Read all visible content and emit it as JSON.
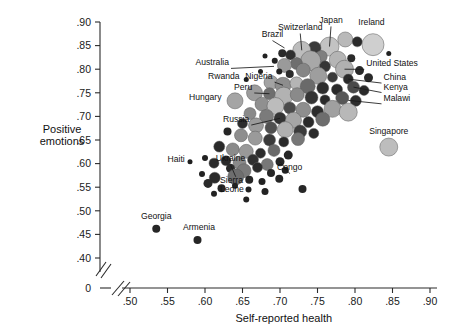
{
  "chart_data": {
    "type": "scatter",
    "title": "",
    "xlabel": "Self-reported health",
    "ylabel": "Positive emotions",
    "xlim": [
      0.475,
      0.905
    ],
    "ylim": [
      0.385,
      0.905
    ],
    "xticks": [
      0.5,
      0.55,
      0.6,
      0.65,
      0.7,
      0.75,
      0.8,
      0.85,
      0.9
    ],
    "xticklabels": [
      ".50",
      ".55",
      ".60",
      ".65",
      ".70",
      ".75",
      ".80",
      ".85",
      ".90"
    ],
    "yticks": [
      0.4,
      0.45,
      0.5,
      0.55,
      0.6,
      0.65,
      0.7,
      0.75,
      0.8,
      0.85,
      0.9
    ],
    "yticklabels": [
      ".40",
      ".45",
      ".50",
      ".55",
      ".60",
      ".65",
      ".70",
      ".75",
      ".80",
      ".85",
      ".90"
    ],
    "origin_label": "0",
    "axis_break": true,
    "grid": false,
    "legend": "none",
    "size_encoding": "bubble area",
    "color_encoding": "grayscale shade",
    "points": [
      {
        "x": 0.787,
        "y": 0.863,
        "r": 7.5,
        "c": "#b9b9b9"
      },
      {
        "x": 0.803,
        "y": 0.858,
        "r": 5.0,
        "c": "#2a2a2a"
      },
      {
        "x": 0.824,
        "y": 0.852,
        "r": 11.0,
        "c": "#cfcfcf"
      },
      {
        "x": 0.766,
        "y": 0.848,
        "r": 9.5,
        "c": "#c3c3c3"
      },
      {
        "x": 0.746,
        "y": 0.845,
        "r": 6.5,
        "c": "#3a3a3a"
      },
      {
        "x": 0.729,
        "y": 0.84,
        "r": 9.0,
        "c": "#bdbdbd"
      },
      {
        "x": 0.714,
        "y": 0.83,
        "r": 5.0,
        "c": "#2e2e2e"
      },
      {
        "x": 0.703,
        "y": 0.834,
        "r": 4.0,
        "c": "#2a2a2a"
      },
      {
        "x": 0.755,
        "y": 0.827,
        "r": 6.0,
        "c": "#7f7f7f"
      },
      {
        "x": 0.777,
        "y": 0.82,
        "r": 8.5,
        "c": "#b5b5b5"
      },
      {
        "x": 0.795,
        "y": 0.823,
        "r": 4.0,
        "c": "#2a2a2a"
      },
      {
        "x": 0.845,
        "y": 0.833,
        "r": 2.5,
        "c": "#222"
      },
      {
        "x": 0.741,
        "y": 0.818,
        "r": 10.0,
        "c": "#a8a8a8"
      },
      {
        "x": 0.722,
        "y": 0.812,
        "r": 6.0,
        "c": "#6e6e6e"
      },
      {
        "x": 0.706,
        "y": 0.808,
        "r": 7.0,
        "c": "#9a9a9a"
      },
      {
        "x": 0.693,
        "y": 0.818,
        "r": 3.0,
        "c": "#222"
      },
      {
        "x": 0.68,
        "y": 0.828,
        "r": 2.5,
        "c": "#222"
      },
      {
        "x": 0.76,
        "y": 0.806,
        "r": 5.5,
        "c": "#353535"
      },
      {
        "x": 0.786,
        "y": 0.8,
        "r": 9.0,
        "c": "#b0b0b0"
      },
      {
        "x": 0.806,
        "y": 0.797,
        "r": 4.5,
        "c": "#2a2a2a"
      },
      {
        "x": 0.731,
        "y": 0.798,
        "r": 7.0,
        "c": "#858585"
      },
      {
        "x": 0.713,
        "y": 0.79,
        "r": 4.0,
        "c": "#2c2c2c"
      },
      {
        "x": 0.699,
        "y": 0.795,
        "r": 3.0,
        "c": "#222"
      },
      {
        "x": 0.674,
        "y": 0.795,
        "r": 2.5,
        "c": "#222"
      },
      {
        "x": 0.751,
        "y": 0.786,
        "r": 8.5,
        "c": "#9e9e9e"
      },
      {
        "x": 0.77,
        "y": 0.783,
        "r": 5.0,
        "c": "#3a3a3a"
      },
      {
        "x": 0.791,
        "y": 0.779,
        "r": 5.0,
        "c": "#2a2a2a"
      },
      {
        "x": 0.818,
        "y": 0.782,
        "r": 4.5,
        "c": "#2a2a2a"
      },
      {
        "x": 0.655,
        "y": 0.778,
        "r": 2.5,
        "c": "#1f1f1f"
      },
      {
        "x": 0.688,
        "y": 0.772,
        "r": 7.0,
        "c": "#a3a3a3"
      },
      {
        "x": 0.704,
        "y": 0.766,
        "r": 8.0,
        "c": "#8d8d8d"
      },
      {
        "x": 0.722,
        "y": 0.77,
        "r": 6.5,
        "c": "#b5b5b5"
      },
      {
        "x": 0.737,
        "y": 0.764,
        "r": 7.5,
        "c": "#6a6a6a"
      },
      {
        "x": 0.757,
        "y": 0.76,
        "r": 6.0,
        "c": "#2f2f2f"
      },
      {
        "x": 0.776,
        "y": 0.757,
        "r": 5.5,
        "c": "#2a2a2a"
      },
      {
        "x": 0.798,
        "y": 0.762,
        "r": 6.0,
        "c": "#4a4a4a"
      },
      {
        "x": 0.812,
        "y": 0.755,
        "r": 5.0,
        "c": "#2a2a2a"
      },
      {
        "x": 0.666,
        "y": 0.75,
        "r": 8.0,
        "c": "#9c9c9c"
      },
      {
        "x": 0.686,
        "y": 0.748,
        "r": 6.0,
        "c": "#6f6f6f"
      },
      {
        "x": 0.705,
        "y": 0.743,
        "r": 9.0,
        "c": "#b2b2b2"
      },
      {
        "x": 0.723,
        "y": 0.746,
        "r": 7.0,
        "c": "#8a8a8a"
      },
      {
        "x": 0.742,
        "y": 0.74,
        "r": 6.5,
        "c": "#353535"
      },
      {
        "x": 0.76,
        "y": 0.735,
        "r": 5.0,
        "c": "#2a2a2a"
      },
      {
        "x": 0.783,
        "y": 0.739,
        "r": 6.5,
        "c": "#585858"
      },
      {
        "x": 0.801,
        "y": 0.733,
        "r": 5.5,
        "c": "#2e2e2e"
      },
      {
        "x": 0.64,
        "y": 0.733,
        "r": 8.0,
        "c": "#a5a5a5"
      },
      {
        "x": 0.676,
        "y": 0.726,
        "r": 7.0,
        "c": "#909090"
      },
      {
        "x": 0.694,
        "y": 0.722,
        "r": 8.5,
        "c": "#bcbcbc"
      },
      {
        "x": 0.713,
        "y": 0.718,
        "r": 6.0,
        "c": "#4b4b4b"
      },
      {
        "x": 0.731,
        "y": 0.714,
        "r": 7.5,
        "c": "#8e8e8e"
      },
      {
        "x": 0.75,
        "y": 0.71,
        "r": 6.0,
        "c": "#2c2c2c"
      },
      {
        "x": 0.77,
        "y": 0.716,
        "r": 8.5,
        "c": "#a0a0a0"
      },
      {
        "x": 0.791,
        "y": 0.709,
        "r": 9.0,
        "c": "#b8b8b8"
      },
      {
        "x": 0.66,
        "y": 0.706,
        "r": 6.0,
        "c": "#8a8a8a"
      },
      {
        "x": 0.682,
        "y": 0.7,
        "r": 7.0,
        "c": "#7b7b7b"
      },
      {
        "x": 0.7,
        "y": 0.696,
        "r": 6.0,
        "c": "#333"
      },
      {
        "x": 0.718,
        "y": 0.692,
        "r": 8.0,
        "c": "#a6a6a6"
      },
      {
        "x": 0.738,
        "y": 0.688,
        "r": 5.5,
        "c": "#2a2a2a"
      },
      {
        "x": 0.757,
        "y": 0.694,
        "r": 7.0,
        "c": "#6d6d6d"
      },
      {
        "x": 0.65,
        "y": 0.685,
        "r": 5.0,
        "c": "#2d2d2d"
      },
      {
        "x": 0.668,
        "y": 0.681,
        "r": 7.5,
        "c": "#9b9b9b"
      },
      {
        "x": 0.688,
        "y": 0.676,
        "r": 6.0,
        "c": "#505050"
      },
      {
        "x": 0.707,
        "y": 0.672,
        "r": 8.0,
        "c": "#b0b0b0"
      },
      {
        "x": 0.727,
        "y": 0.668,
        "r": 6.5,
        "c": "#3c3c3c"
      },
      {
        "x": 0.745,
        "y": 0.664,
        "r": 5.0,
        "c": "#2a2a2a"
      },
      {
        "x": 0.63,
        "y": 0.668,
        "r": 4.0,
        "c": "#262626"
      },
      {
        "x": 0.648,
        "y": 0.66,
        "r": 6.5,
        "c": "#8f8f8f"
      },
      {
        "x": 0.667,
        "y": 0.654,
        "r": 7.0,
        "c": "#9a9a9a"
      },
      {
        "x": 0.686,
        "y": 0.65,
        "r": 6.0,
        "c": "#3a3a3a"
      },
      {
        "x": 0.705,
        "y": 0.646,
        "r": 5.0,
        "c": "#2a2a2a"
      },
      {
        "x": 0.724,
        "y": 0.652,
        "r": 6.5,
        "c": "#777"
      },
      {
        "x": 0.845,
        "y": 0.635,
        "r": 9.0,
        "c": "#bdbdbd"
      },
      {
        "x": 0.619,
        "y": 0.636,
        "r": 5.5,
        "c": "#2a2a2a"
      },
      {
        "x": 0.637,
        "y": 0.63,
        "r": 6.5,
        "c": "#8b8b8b"
      },
      {
        "x": 0.655,
        "y": 0.626,
        "r": 7.0,
        "c": "#999"
      },
      {
        "x": 0.674,
        "y": 0.622,
        "r": 5.0,
        "c": "#2c2c2c"
      },
      {
        "x": 0.692,
        "y": 0.628,
        "r": 6.0,
        "c": "#6a6a6a"
      },
      {
        "x": 0.711,
        "y": 0.618,
        "r": 4.5,
        "c": "#262626"
      },
      {
        "x": 0.6,
        "y": 0.612,
        "r": 3.0,
        "c": "#222"
      },
      {
        "x": 0.628,
        "y": 0.606,
        "r": 5.0,
        "c": "#2a2a2a"
      },
      {
        "x": 0.646,
        "y": 0.602,
        "r": 6.5,
        "c": "#8a8a8a"
      },
      {
        "x": 0.664,
        "y": 0.608,
        "r": 5.5,
        "c": "#303030"
      },
      {
        "x": 0.683,
        "y": 0.598,
        "r": 6.0,
        "c": "#787878"
      },
      {
        "x": 0.7,
        "y": 0.604,
        "r": 4.5,
        "c": "#262626"
      },
      {
        "x": 0.58,
        "y": 0.604,
        "r": 2.5,
        "c": "#1f1f1f"
      },
      {
        "x": 0.612,
        "y": 0.601,
        "r": 5.0,
        "c": "#2a2a2a"
      },
      {
        "x": 0.634,
        "y": 0.59,
        "r": 4.5,
        "c": "#2a2a2a"
      },
      {
        "x": 0.652,
        "y": 0.585,
        "r": 7.0,
        "c": "#7a7a7a"
      },
      {
        "x": 0.67,
        "y": 0.592,
        "r": 5.0,
        "c": "#2a2a2a"
      },
      {
        "x": 0.688,
        "y": 0.58,
        "r": 4.0,
        "c": "#262626"
      },
      {
        "x": 0.707,
        "y": 0.586,
        "r": 3.5,
        "c": "#222"
      },
      {
        "x": 0.596,
        "y": 0.578,
        "r": 3.0,
        "c": "#222"
      },
      {
        "x": 0.613,
        "y": 0.57,
        "r": 5.5,
        "c": "#2a2a2a"
      },
      {
        "x": 0.641,
        "y": 0.572,
        "r": 8.0,
        "c": "#6e6e6e"
      },
      {
        "x": 0.659,
        "y": 0.566,
        "r": 4.0,
        "c": "#262626"
      },
      {
        "x": 0.676,
        "y": 0.562,
        "r": 3.5,
        "c": "#222"
      },
      {
        "x": 0.699,
        "y": 0.568,
        "r": 4.0,
        "c": "#262626"
      },
      {
        "x": 0.604,
        "y": 0.558,
        "r": 4.5,
        "c": "#2a2a2a"
      },
      {
        "x": 0.622,
        "y": 0.548,
        "r": 4.0,
        "c": "#262626"
      },
      {
        "x": 0.64,
        "y": 0.553,
        "r": 3.0,
        "c": "#222"
      },
      {
        "x": 0.658,
        "y": 0.545,
        "r": 3.0,
        "c": "#222"
      },
      {
        "x": 0.68,
        "y": 0.541,
        "r": 3.5,
        "c": "#222"
      },
      {
        "x": 0.73,
        "y": 0.546,
        "r": 4.0,
        "c": "#262626"
      },
      {
        "x": 0.612,
        "y": 0.536,
        "r": 3.0,
        "c": "#222"
      },
      {
        "x": 0.655,
        "y": 0.524,
        "r": 3.0,
        "c": "#222"
      },
      {
        "x": 0.535,
        "y": 0.462,
        "r": 4.0,
        "c": "#262626"
      },
      {
        "x": 0.59,
        "y": 0.438,
        "r": 4.0,
        "c": "#262626"
      }
    ],
    "labeled_points": [
      {
        "name": "Ireland",
        "x": 0.824,
        "y": 0.852,
        "label_x": 0.822,
        "label_y": 0.893,
        "anchor": "middle",
        "leader": false
      },
      {
        "name": "Japan",
        "x": 0.766,
        "y": 0.848,
        "label_x": 0.768,
        "label_y": 0.898,
        "anchor": "middle",
        "leader": true
      },
      {
        "name": "Switzerland",
        "x": 0.729,
        "y": 0.84,
        "label_x": 0.727,
        "label_y": 0.883,
        "anchor": "middle",
        "leader": true
      },
      {
        "name": "Brazil",
        "x": 0.706,
        "y": 0.845,
        "label_x": 0.69,
        "label_y": 0.868,
        "anchor": "middle",
        "leader": true
      },
      {
        "name": "Australia",
        "x": 0.692,
        "y": 0.806,
        "label_x": 0.632,
        "label_y": 0.808,
        "anchor": "end",
        "leader": true
      },
      {
        "name": "United States",
        "x": 0.786,
        "y": 0.8,
        "label_x": 0.815,
        "label_y": 0.806,
        "anchor": "start",
        "leader": true
      },
      {
        "name": "China",
        "x": 0.791,
        "y": 0.779,
        "label_x": 0.838,
        "label_y": 0.777,
        "anchor": "start",
        "leader": true
      },
      {
        "name": "Kenya",
        "x": 0.798,
        "y": 0.762,
        "label_x": 0.838,
        "label_y": 0.757,
        "anchor": "start",
        "leader": true
      },
      {
        "name": "Malawi",
        "x": 0.791,
        "y": 0.734,
        "label_x": 0.838,
        "label_y": 0.733,
        "anchor": "start",
        "leader": true
      },
      {
        "name": "Rwanda",
        "x": 0.655,
        "y": 0.778,
        "label_x": 0.646,
        "label_y": 0.779,
        "anchor": "end",
        "leader": false
      },
      {
        "name": "Nigeria",
        "x": 0.704,
        "y": 0.766,
        "label_x": 0.69,
        "label_y": 0.779,
        "anchor": "end",
        "leader": true
      },
      {
        "name": "Peru",
        "x": 0.686,
        "y": 0.748,
        "label_x": 0.663,
        "label_y": 0.756,
        "anchor": "end",
        "leader": true
      },
      {
        "name": "Hungary",
        "x": 0.64,
        "y": 0.733,
        "label_x": 0.622,
        "label_y": 0.734,
        "anchor": "end",
        "leader": false
      },
      {
        "name": "Russia",
        "x": 0.7,
        "y": 0.696,
        "label_x": 0.659,
        "label_y": 0.688,
        "anchor": "end",
        "leader": true
      },
      {
        "name": "Singapore",
        "x": 0.845,
        "y": 0.635,
        "label_x": 0.845,
        "label_y": 0.663,
        "anchor": "middle",
        "leader": false
      },
      {
        "name": "Ukraine",
        "x": 0.641,
        "y": 0.572,
        "label_x": 0.634,
        "label_y": 0.605,
        "anchor": "middle",
        "leader": true
      },
      {
        "name": "Haiti",
        "x": 0.58,
        "y": 0.604,
        "label_x": 0.573,
        "label_y": 0.604,
        "anchor": "end",
        "leader": false
      },
      {
        "name": "Sierra Leone",
        "x": 0.613,
        "y": 0.57,
        "label_x": 0.62,
        "label_y": 0.558,
        "anchor": "start",
        "leader": false
      },
      {
        "name": "Congo",
        "x": 0.7,
        "y": 0.604,
        "label_x": 0.713,
        "label_y": 0.586,
        "anchor": "middle",
        "leader": true
      },
      {
        "name": "Georgia",
        "x": 0.535,
        "y": 0.462,
        "label_x": 0.535,
        "label_y": 0.482,
        "anchor": "middle",
        "leader": false
      },
      {
        "name": "Armenia",
        "x": 0.59,
        "y": 0.438,
        "label_x": 0.592,
        "label_y": 0.46,
        "anchor": "middle",
        "leader": false
      }
    ]
  }
}
